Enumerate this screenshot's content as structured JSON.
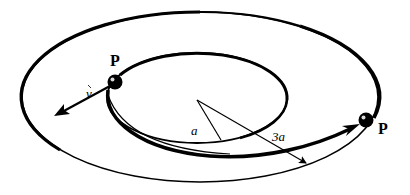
{
  "diagram": {
    "labels": {
      "point_start": "P",
      "point_end": "P",
      "velocity": "v",
      "inner_radius": "a",
      "outer_radius": "3a"
    },
    "elements": {
      "outer_orbit": {
        "radius_label": "3a",
        "style": "thick-left, thin-bottom"
      },
      "inner_orbit": {
        "radius_label": "a",
        "style": "thick"
      },
      "transfer_path": {
        "from": "inner orbit point P",
        "to": "outer orbit point P",
        "style": "thick arrow"
      },
      "velocity_vector": {
        "label": "v",
        "direction": "away from orbit, outward-left"
      }
    },
    "colors": {
      "ink": "#000000",
      "background": "#ffffff"
    }
  }
}
